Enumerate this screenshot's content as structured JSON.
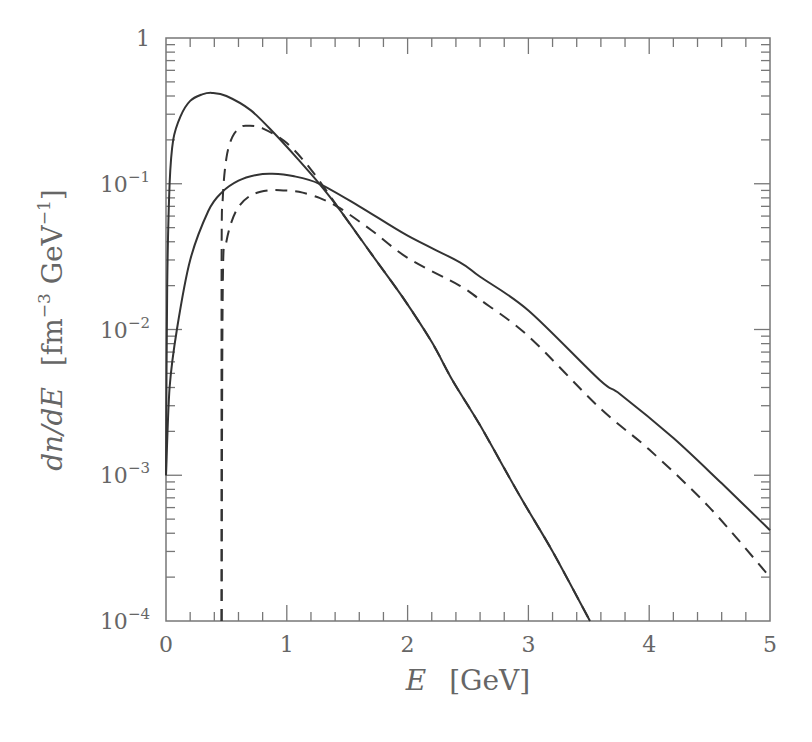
{
  "chart_data": {
    "type": "line",
    "title": "",
    "xlabel": "E [GeV]",
    "ylabel": "dn/dE [fm^-3 GeV^-1]",
    "xlabel_parts": {
      "var": "E",
      "unit": "[GeV]"
    },
    "ylabel_parts": {
      "var": "dn/dE",
      "unit_pre": "[fm",
      "exp1": "−3",
      "unit_mid": " GeV",
      "exp2": "−1",
      "unit_post": "]"
    },
    "xlim": [
      0,
      5
    ],
    "ylim": [
      0.0001,
      1
    ],
    "yscale": "log",
    "grid": false,
    "legend": null,
    "x_ticks": [
      "0",
      "1",
      "2",
      "3",
      "4",
      "5"
    ],
    "y_ticks": [
      {
        "value": 1,
        "base": "1",
        "exp": ""
      },
      {
        "value": 0.1,
        "base": "10",
        "exp": "−1"
      },
      {
        "value": 0.01,
        "base": "10",
        "exp": "−2"
      },
      {
        "value": 0.001,
        "base": "10",
        "exp": "−3"
      },
      {
        "value": 0.0001,
        "base": "10",
        "exp": "−4"
      }
    ],
    "series": [
      {
        "name": "narrow-solid",
        "style": "solid",
        "x": [
          0.0,
          0.01,
          0.03,
          0.06,
          0.12,
          0.2,
          0.3,
          0.38,
          0.5,
          0.7,
          0.9,
          1.1,
          1.27,
          1.44,
          1.7,
          1.96,
          2.2,
          2.37,
          2.6,
          2.93,
          3.2,
          3.51
        ],
        "values": [
          0.001,
          0.02,
          0.1,
          0.2,
          0.29,
          0.37,
          0.41,
          0.42,
          0.4,
          0.32,
          0.22,
          0.145,
          0.1,
          0.066,
          0.033,
          0.0166,
          0.0082,
          0.0045,
          0.0022,
          0.00072,
          0.0003,
          0.0001
        ]
      },
      {
        "name": "narrow-dashed",
        "style": "dashed",
        "x": [
          0.46,
          0.46,
          0.47,
          0.5,
          0.55,
          0.62,
          0.68,
          0.8,
          1.0,
          1.2,
          1.44,
          1.7,
          1.96,
          2.2,
          2.37,
          2.6,
          2.93,
          3.2,
          3.51
        ],
        "values": [
          0.0001,
          0.03,
          0.08,
          0.15,
          0.21,
          0.245,
          0.25,
          0.24,
          0.19,
          0.125,
          0.066,
          0.033,
          0.0166,
          0.0082,
          0.0045,
          0.0022,
          0.00072,
          0.0003,
          0.0001
        ]
      },
      {
        "name": "broad-solid",
        "style": "solid",
        "x": [
          0.0,
          0.03,
          0.09,
          0.2,
          0.35,
          0.46,
          0.6,
          0.75,
          0.88,
          1.05,
          1.27,
          1.6,
          2.0,
          2.43,
          2.6,
          3.0,
          3.59,
          3.76,
          4.2,
          4.6,
          5.0
        ],
        "values": [
          0.001,
          0.004,
          0.01,
          0.03,
          0.065,
          0.087,
          0.105,
          0.115,
          0.117,
          0.113,
          0.1,
          0.07,
          0.044,
          0.029,
          0.023,
          0.0135,
          0.0045,
          0.0036,
          0.0018,
          0.00088,
          0.00042
        ]
      },
      {
        "name": "broad-dashed",
        "style": "dashed",
        "x": [
          0.46,
          0.47,
          0.5,
          0.58,
          0.7,
          0.85,
          0.97,
          1.1,
          1.27,
          1.44,
          1.7,
          2.0,
          2.43,
          2.6,
          3.0,
          3.59,
          4.0,
          4.5,
          5.0
        ],
        "values": [
          0.0001,
          0.02,
          0.04,
          0.065,
          0.083,
          0.09,
          0.09,
          0.088,
          0.08,
          0.068,
          0.048,
          0.031,
          0.02,
          0.016,
          0.009,
          0.0029,
          0.0015,
          0.0006,
          0.0002
        ]
      }
    ]
  }
}
